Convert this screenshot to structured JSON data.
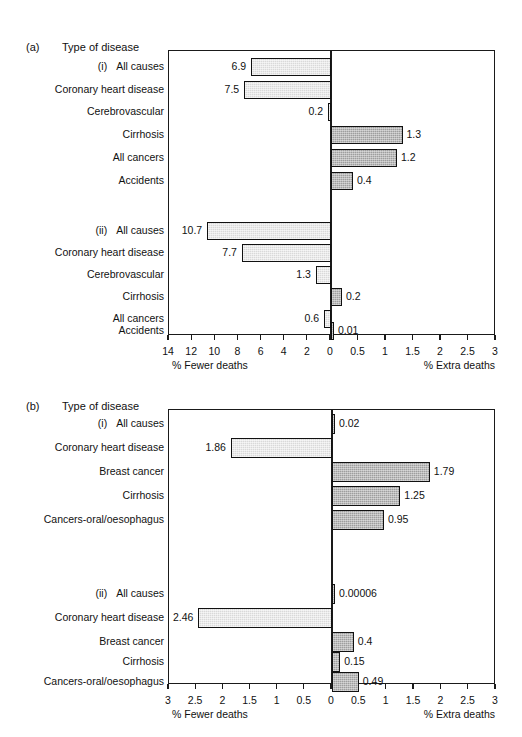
{
  "figure": {
    "panels": [
      {
        "tag": "(a)",
        "heading": "Type of disease",
        "axis_left_label": "% Fewer deaths",
        "axis_right_label": "% Extra deaths",
        "left_ticks": [
          "14",
          "12",
          "10",
          "8",
          "6",
          "4",
          "2",
          "0"
        ],
        "right_ticks": [
          "0",
          "0.5",
          "1",
          "1.5",
          "2",
          "2.5",
          "3"
        ],
        "groups": [
          {
            "numeral": "(i)",
            "rows": [
              {
                "label": "All causes",
                "value": "6.9",
                "side": "left",
                "magnitude": 6.9
              },
              {
                "label": "Coronary heart disease",
                "value": "7.5",
                "side": "left",
                "magnitude": 7.5
              },
              {
                "label": "Cerebrovascular",
                "value": "0.2",
                "side": "left",
                "magnitude": 0.2
              },
              {
                "label": "Cirrhosis",
                "value": "1.3",
                "side": "right",
                "magnitude": 1.3
              },
              {
                "label": "All cancers",
                "value": "1.2",
                "side": "right",
                "magnitude": 1.2
              },
              {
                "label": "Accidents",
                "value": "0.4",
                "side": "right",
                "magnitude": 0.4
              }
            ]
          },
          {
            "numeral": "(ii)",
            "rows": [
              {
                "label": "All causes",
                "value": "10.7",
                "side": "left",
                "magnitude": 10.7
              },
              {
                "label": "Coronary heart disease",
                "value": "7.7",
                "side": "left",
                "magnitude": 7.7
              },
              {
                "label": "Cerebrovascular",
                "value": "1.3",
                "side": "left",
                "magnitude": 1.3
              },
              {
                "label": "Cirrhosis",
                "value": "0.2",
                "side": "right",
                "magnitude": 0.2
              },
              {
                "label": "All cancers",
                "value": "0.6",
                "side": "left",
                "magnitude": 0.6
              },
              {
                "label": "Accidents",
                "value": "0.01",
                "side": "right",
                "magnitude": 0.01
              }
            ]
          }
        ]
      },
      {
        "tag": "(b)",
        "heading": "Type of disease",
        "axis_left_label": "% Fewer deaths",
        "axis_right_label": "% Extra deaths",
        "left_ticks": [
          "3",
          "2.5",
          "2",
          "1.5",
          "1",
          "0.5",
          "0"
        ],
        "right_ticks": [
          "0",
          "0.5",
          "1",
          "1.5",
          "2",
          "2.5",
          "3"
        ],
        "groups": [
          {
            "numeral": "(i)",
            "rows": [
              {
                "label": "All causes",
                "value": "0.02",
                "side": "right",
                "magnitude": 0.02
              },
              {
                "label": "Coronary heart disease",
                "value": "1.86",
                "side": "left",
                "magnitude": 1.86
              },
              {
                "label": "Breast cancer",
                "value": "1.79",
                "side": "right",
                "magnitude": 1.79
              },
              {
                "label": "Cirrhosis",
                "value": "1.25",
                "side": "right",
                "magnitude": 1.25
              },
              {
                "label": "Cancers-oral/oesophagus",
                "value": "0.95",
                "side": "right",
                "magnitude": 0.95
              }
            ]
          },
          {
            "numeral": "(ii)",
            "rows": [
              {
                "label": "All causes",
                "value": "0.00006",
                "side": "right",
                "magnitude": 6e-05
              },
              {
                "label": "Coronary heart disease",
                "value": "2.46",
                "side": "left",
                "magnitude": 2.46
              },
              {
                "label": "Breast cancer",
                "value": "0.4",
                "side": "right",
                "magnitude": 0.4
              },
              {
                "label": "Cirrhosis",
                "value": "0.15",
                "side": "right",
                "magnitude": 0.15
              },
              {
                "label": "Cancers-oral/oesophagus",
                "value": "0.49",
                "side": "right",
                "magnitude": 0.49
              }
            ]
          }
        ]
      }
    ]
  },
  "chart_data": [
    {
      "type": "bar",
      "title": "(a) Type of disease",
      "orientation": "horizontal",
      "xlabel_left": "% Fewer deaths",
      "xlabel_right": "% Extra deaths",
      "xlim_left": [
        14,
        0
      ],
      "xlim_right": [
        0,
        3
      ],
      "xticks_left": [
        14,
        12,
        10,
        8,
        6,
        4,
        2,
        0
      ],
      "xticks_right": [
        0,
        0.5,
        1,
        1.5,
        2,
        2.5,
        3
      ],
      "grid": false,
      "legend": null,
      "groups": [
        {
          "name": "(i)",
          "categories": [
            "All causes",
            "Coronary heart disease",
            "Cerebrovascular",
            "Cirrhosis",
            "All cancers",
            "Accidents"
          ],
          "values": [
            -6.9,
            -7.5,
            -0.2,
            1.3,
            1.2,
            0.4
          ],
          "labels": [
            "6.9",
            "7.5",
            "0.2",
            "1.3",
            "1.2",
            "0.4"
          ]
        },
        {
          "name": "(ii)",
          "categories": [
            "All causes",
            "Coronary heart disease",
            "Cerebrovascular",
            "Cirrhosis",
            "All cancers",
            "Accidents"
          ],
          "values": [
            -10.7,
            -7.7,
            -1.3,
            0.2,
            -0.6,
            0.01
          ],
          "labels": [
            "10.7",
            "7.7",
            "1.3",
            "0.2",
            "0.6",
            "0.01"
          ]
        }
      ]
    },
    {
      "type": "bar",
      "title": "(b) Type of disease",
      "orientation": "horizontal",
      "xlabel_left": "% Fewer deaths",
      "xlabel_right": "% Extra deaths",
      "xlim_left": [
        3,
        0
      ],
      "xlim_right": [
        0,
        3
      ],
      "xticks_left": [
        3,
        2.5,
        2,
        1.5,
        1,
        0.5,
        0
      ],
      "xticks_right": [
        0,
        0.5,
        1,
        1.5,
        2,
        2.5,
        3
      ],
      "grid": false,
      "legend": null,
      "groups": [
        {
          "name": "(i)",
          "categories": [
            "All causes",
            "Coronary heart disease",
            "Breast cancer",
            "Cirrhosis",
            "Cancers-oral/oesophagus"
          ],
          "values": [
            0.02,
            -1.86,
            1.79,
            1.25,
            0.95
          ],
          "labels": [
            "0.02",
            "1.86",
            "1.79",
            "1.25",
            "0.95"
          ]
        },
        {
          "name": "(ii)",
          "categories": [
            "All causes",
            "Coronary heart disease",
            "Breast cancer",
            "Cirrhosis",
            "Cancers-oral/oesophagus"
          ],
          "values": [
            6e-05,
            -2.46,
            0.4,
            0.15,
            0.49
          ],
          "labels": [
            "0.00006",
            "2.46",
            "0.4",
            "0.15",
            "0.49"
          ]
        }
      ]
    }
  ]
}
